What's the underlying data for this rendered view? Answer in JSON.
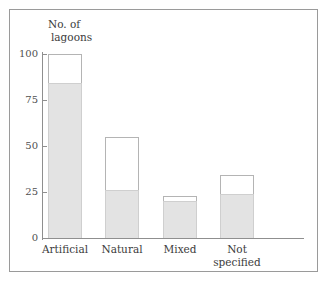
{
  "chart_data": {
    "type": "bar",
    "title": "",
    "ylabel": "No. of lagoons",
    "ylabel_line1": "No. of",
    "ylabel_line2": "lagoons",
    "xlabel": "",
    "ylim": [
      0,
      100
    ],
    "yticks": [
      "0",
      "25",
      "50",
      "75",
      "100"
    ],
    "ytick_values": [
      0,
      25,
      50,
      75,
      100
    ],
    "grid": false,
    "legend": "none",
    "categories": [
      "Artificial",
      "Natural",
      "Mixed",
      "Not specified"
    ],
    "category_labels": [
      {
        "line1": "Artificial",
        "line2": ""
      },
      {
        "line1": "Natural",
        "line2": ""
      },
      {
        "line1": "Mixed",
        "line2": ""
      },
      {
        "line1": "Not",
        "line2": "specified"
      }
    ],
    "series": [
      {
        "name": "Total",
        "values": [
          100,
          55,
          23,
          34
        ]
      },
      {
        "name": "Shaded",
        "values": [
          84,
          26,
          20,
          24
        ]
      }
    ],
    "values": [
      100,
      55,
      23,
      34
    ],
    "shaded_values": [
      84,
      26,
      20,
      24
    ],
    "colors": {
      "fill": "#e3e3e3",
      "outline": "#b4b4b4",
      "axis": "#8f8f8f",
      "text": "#3c3c3c",
      "frame": "#9a9a9a",
      "background": "#ffffff"
    }
  }
}
